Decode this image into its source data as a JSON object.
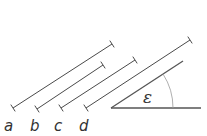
{
  "diagram": {
    "segments": [
      {
        "label": "a",
        "x1": 13,
        "y1": 108,
        "x2": 112,
        "y2": 44
      },
      {
        "label": "b",
        "x1": 37,
        "y1": 109,
        "x2": 103,
        "y2": 65
      },
      {
        "label": "c",
        "x1": 61,
        "y1": 108,
        "x2": 135,
        "y2": 60
      },
      {
        "label": "d",
        "x1": 86,
        "y1": 108,
        "x2": 190,
        "y2": 40
      }
    ],
    "angle": {
      "label": "ε",
      "vertex": [
        111,
        108
      ],
      "ray_end": [
        183,
        61
      ],
      "base_end": [
        201,
        108
      ]
    },
    "colors": {
      "line": "#4a4a4a",
      "arc": "#9a9a9a",
      "text": "#333333"
    }
  }
}
